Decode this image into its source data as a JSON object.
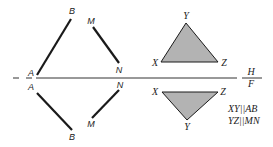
{
  "diagram": {
    "title": "",
    "fold_line": {
      "labels": {
        "top": "H",
        "bottom": "F"
      }
    },
    "lines": {
      "top": {
        "ab": {
          "start": "A",
          "end": "B"
        },
        "mn": {
          "start": "M",
          "end": "N"
        }
      },
      "bottom": {
        "ab": {
          "start": "A",
          "end": "B"
        },
        "mn": {
          "start": "N",
          "end": "M"
        }
      }
    },
    "triangles": {
      "top": {
        "apex": "Y",
        "left": "X",
        "right": "Z"
      },
      "bottom": {
        "left": "X",
        "right": "Z",
        "apex": "Y"
      }
    },
    "notes": [
      "XY||AB",
      "YZ||MN"
    ],
    "colors": {
      "line": "#1a1a1a",
      "fill": "#b3b3b3",
      "fold": "#333333"
    }
  }
}
